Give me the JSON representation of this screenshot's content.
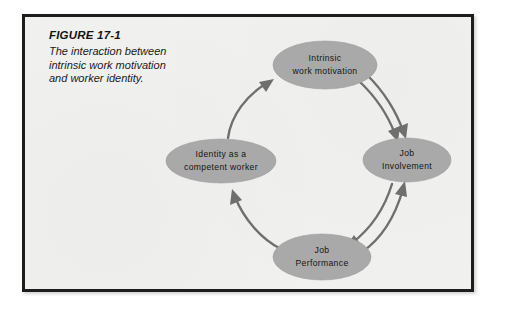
{
  "figure": {
    "number_label": "FIGURE 17-1",
    "caption": "The interaction between intrinsic work motivation and worker identity.",
    "frame_color": "#1d1d1d",
    "background_color": "#f1f1f0"
  },
  "diagram": {
    "type": "cycle-diagram",
    "node_fill_color": "#a9a9a9",
    "arrow_color": "#6f6f6f",
    "nodes": [
      {
        "id": "intrinsic-work-motivation",
        "line1": "Intrinsic",
        "line2": "work motivation",
        "position": "top",
        "cx": 300,
        "cy": 48,
        "rx": 52,
        "ry": 24
      },
      {
        "id": "job-involvement",
        "line1": "Job",
        "line2": "Involvement",
        "position": "right",
        "cx": 382,
        "cy": 143,
        "rx": 44,
        "ry": 22
      },
      {
        "id": "job-performance",
        "line1": "Job",
        "line2": "Performance",
        "position": "bottom",
        "cx": 297,
        "cy": 240,
        "rx": 49,
        "ry": 23
      },
      {
        "id": "identity-as-competent-worker",
        "line1": "Identity as a",
        "line2": "competent worker",
        "position": "left",
        "cx": 196,
        "cy": 144,
        "rx": 55,
        "ry": 22
      }
    ],
    "arrows": [
      {
        "id": "motivation-to-involvement-a",
        "from": "intrinsic-work-motivation",
        "to": "job-involvement",
        "direction": "down-right"
      },
      {
        "id": "motivation-to-involvement-b",
        "from": "intrinsic-work-motivation",
        "to": "job-involvement",
        "direction": "down-right"
      },
      {
        "id": "involvement-to-performance",
        "from": "job-involvement",
        "to": "job-performance",
        "direction": "down-left"
      },
      {
        "id": "performance-to-involvement",
        "from": "job-performance",
        "to": "job-involvement",
        "direction": "up-right"
      },
      {
        "id": "performance-to-identity",
        "from": "job-performance",
        "to": "identity-as-competent-worker",
        "direction": "up-left"
      },
      {
        "id": "identity-to-motivation",
        "from": "identity-as-competent-worker",
        "to": "intrinsic-work-motivation",
        "direction": "up-right"
      }
    ]
  }
}
